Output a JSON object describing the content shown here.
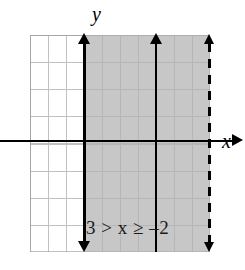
{
  "figure": {
    "kind": "number-plane-inequality-graph",
    "axis_labels": {
      "x": "x",
      "y": "y"
    },
    "annotation": "3 > x ≥ –2",
    "colors": {
      "shade": "#b2b2b2",
      "grid": "#8f8f8f",
      "axis": "#000000",
      "background": "#ffffff"
    }
  },
  "chart_data": {
    "type": "area",
    "title": "",
    "subtitle": "",
    "xlabel": "x",
    "ylabel": "y",
    "annotations": [
      "3 > x ≥ –2"
    ],
    "grid": true,
    "legend": "none",
    "xlim": [
      -7,
      3
    ],
    "ylim": [
      -4,
      4
    ],
    "x_gridlines": [
      -7,
      -6,
      -5,
      -4,
      -3,
      -2,
      -1,
      0,
      1,
      2,
      3
    ],
    "y_gridlines": [
      -4,
      -3,
      -2,
      -1,
      0,
      1,
      2,
      3,
      4
    ],
    "series": [
      {
        "name": "3 > x ≥ –2",
        "shaded_interval": [
          -2,
          3
        ],
        "shaded_fill": "#b2b2b2",
        "boundaries": [
          {
            "name": "x = -2",
            "value": -2,
            "orientation": "vertical",
            "style": "solid",
            "included": true,
            "arrows": "both"
          },
          {
            "name": "x = 3",
            "value": 3,
            "orientation": "vertical",
            "style": "dashed",
            "included": false,
            "arrows": "both"
          }
        ]
      }
    ]
  }
}
